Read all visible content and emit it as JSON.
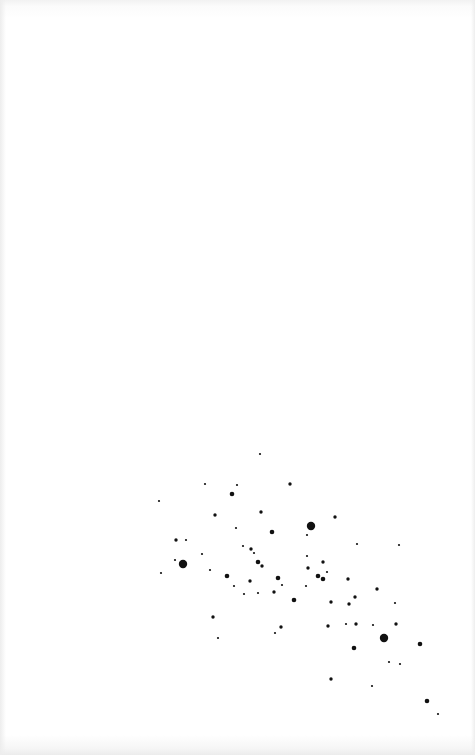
{
  "image": {
    "subject": "star-field",
    "background_color": "#ffffff",
    "dot_color": "#111111",
    "size_radius_px": {
      "tiny": 1.1,
      "small": 1.7,
      "medium": 2.3,
      "large": 4.2
    },
    "stars": [
      {
        "x": 260,
        "y": 454,
        "s": "tiny"
      },
      {
        "x": 205,
        "y": 484,
        "s": "tiny"
      },
      {
        "x": 237,
        "y": 485,
        "s": "tiny"
      },
      {
        "x": 290,
        "y": 484,
        "s": "small"
      },
      {
        "x": 232,
        "y": 494,
        "s": "medium"
      },
      {
        "x": 159,
        "y": 501,
        "s": "tiny"
      },
      {
        "x": 215,
        "y": 515,
        "s": "small"
      },
      {
        "x": 261,
        "y": 512,
        "s": "small"
      },
      {
        "x": 335,
        "y": 517,
        "s": "small"
      },
      {
        "x": 236,
        "y": 528,
        "s": "tiny"
      },
      {
        "x": 272,
        "y": 532,
        "s": "medium"
      },
      {
        "x": 311,
        "y": 526,
        "s": "large"
      },
      {
        "x": 307,
        "y": 535,
        "s": "tiny"
      },
      {
        "x": 176,
        "y": 540,
        "s": "small"
      },
      {
        "x": 186,
        "y": 540,
        "s": "tiny"
      },
      {
        "x": 243,
        "y": 546,
        "s": "tiny"
      },
      {
        "x": 357,
        "y": 544,
        "s": "tiny"
      },
      {
        "x": 399,
        "y": 545,
        "s": "tiny"
      },
      {
        "x": 251,
        "y": 549,
        "s": "small"
      },
      {
        "x": 254,
        "y": 553,
        "s": "tiny"
      },
      {
        "x": 202,
        "y": 554,
        "s": "tiny"
      },
      {
        "x": 307,
        "y": 556,
        "s": "tiny"
      },
      {
        "x": 175,
        "y": 560,
        "s": "tiny"
      },
      {
        "x": 183,
        "y": 564,
        "s": "large"
      },
      {
        "x": 258,
        "y": 562,
        "s": "medium"
      },
      {
        "x": 262,
        "y": 566,
        "s": "small"
      },
      {
        "x": 323,
        "y": 562,
        "s": "small"
      },
      {
        "x": 308,
        "y": 568,
        "s": "small"
      },
      {
        "x": 210,
        "y": 570,
        "s": "tiny"
      },
      {
        "x": 327,
        "y": 572,
        "s": "tiny"
      },
      {
        "x": 161,
        "y": 573,
        "s": "tiny"
      },
      {
        "x": 227,
        "y": 576,
        "s": "medium"
      },
      {
        "x": 318,
        "y": 576,
        "s": "medium"
      },
      {
        "x": 278,
        "y": 578,
        "s": "medium"
      },
      {
        "x": 323,
        "y": 579,
        "s": "medium"
      },
      {
        "x": 348,
        "y": 579,
        "s": "small"
      },
      {
        "x": 250,
        "y": 581,
        "s": "small"
      },
      {
        "x": 282,
        "y": 585,
        "s": "tiny"
      },
      {
        "x": 234,
        "y": 586,
        "s": "tiny"
      },
      {
        "x": 306,
        "y": 586,
        "s": "tiny"
      },
      {
        "x": 377,
        "y": 589,
        "s": "small"
      },
      {
        "x": 274,
        "y": 592,
        "s": "small"
      },
      {
        "x": 258,
        "y": 593,
        "s": "tiny"
      },
      {
        "x": 244,
        "y": 594,
        "s": "tiny"
      },
      {
        "x": 355,
        "y": 597,
        "s": "small"
      },
      {
        "x": 294,
        "y": 600,
        "s": "medium"
      },
      {
        "x": 331,
        "y": 602,
        "s": "small"
      },
      {
        "x": 395,
        "y": 603,
        "s": "tiny"
      },
      {
        "x": 349,
        "y": 604,
        "s": "small"
      },
      {
        "x": 213,
        "y": 617,
        "s": "small"
      },
      {
        "x": 346,
        "y": 624,
        "s": "tiny"
      },
      {
        "x": 356,
        "y": 624,
        "s": "small"
      },
      {
        "x": 396,
        "y": 624,
        "s": "small"
      },
      {
        "x": 373,
        "y": 625,
        "s": "tiny"
      },
      {
        "x": 328,
        "y": 626,
        "s": "small"
      },
      {
        "x": 281,
        "y": 627,
        "s": "small"
      },
      {
        "x": 275,
        "y": 633,
        "s": "tiny"
      },
      {
        "x": 218,
        "y": 638,
        "s": "tiny"
      },
      {
        "x": 384,
        "y": 638,
        "s": "large"
      },
      {
        "x": 420,
        "y": 644,
        "s": "medium"
      },
      {
        "x": 354,
        "y": 648,
        "s": "medium"
      },
      {
        "x": 389,
        "y": 662,
        "s": "tiny"
      },
      {
        "x": 400,
        "y": 664,
        "s": "tiny"
      },
      {
        "x": 331,
        "y": 679,
        "s": "small"
      },
      {
        "x": 372,
        "y": 686,
        "s": "tiny"
      },
      {
        "x": 427,
        "y": 701,
        "s": "medium"
      },
      {
        "x": 438,
        "y": 714,
        "s": "tiny"
      }
    ]
  }
}
